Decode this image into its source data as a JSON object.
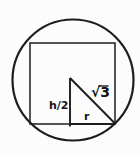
{
  "diagram": {
    "labels": {
      "half_height": "h/2",
      "hypotenuse": "√3",
      "radius": "r"
    },
    "colors": {
      "line": "#1c1c1c",
      "background": "#fcfcfc"
    }
  }
}
